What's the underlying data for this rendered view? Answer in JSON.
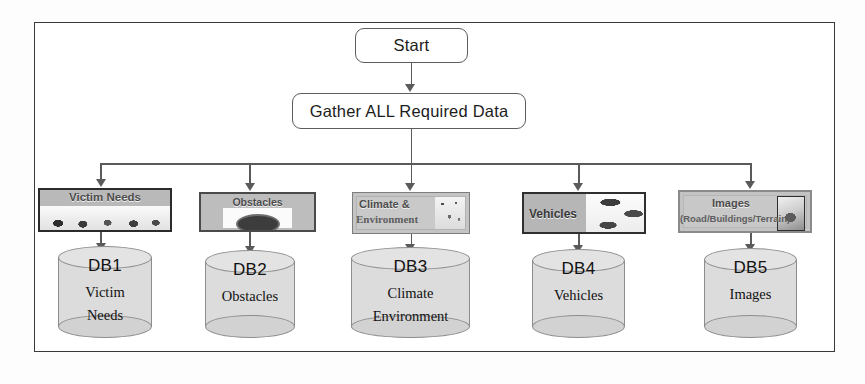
{
  "diagram": {
    "start_label": "Start",
    "process_label": "Gather ALL Required Data",
    "accent_color": "#5a5a5a",
    "frame_color": "#3a3a3a",
    "branches": [
      {
        "key": "victim-needs",
        "box_label": "Victim Needs",
        "box_sublabel": "",
        "db_id": "DB1",
        "db_name_line1": "Victim",
        "db_name_line2": "Needs"
      },
      {
        "key": "obstacles",
        "box_label": "Obstacles",
        "box_sublabel": "",
        "db_id": "DB2",
        "db_name_line1": "Obstacles",
        "db_name_line2": ""
      },
      {
        "key": "climate-environment",
        "box_label": "Climate &",
        "box_sublabel": "Environment",
        "db_id": "DB3",
        "db_name_line1": "Climate",
        "db_name_line2": "Environment"
      },
      {
        "key": "vehicles",
        "box_label": "Vehicles",
        "box_sublabel": "",
        "db_id": "DB4",
        "db_name_line1": "Vehicles",
        "db_name_line2": ""
      },
      {
        "key": "images",
        "box_label": "Images",
        "box_sublabel": "(Road/Buildings/Terrain)",
        "db_id": "DB5",
        "db_name_line1": "Images",
        "db_name_line2": ""
      }
    ]
  }
}
